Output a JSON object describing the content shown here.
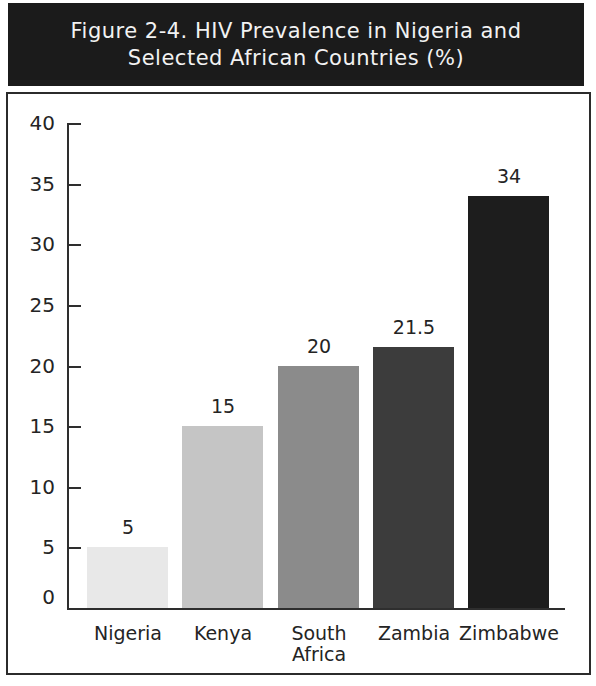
{
  "title": {
    "line1": "Figure 2-4. HIV Prevalence in Nigeria and",
    "line2": "Selected African Countries (%)"
  },
  "colors": {
    "title_bg": "#1b1b1b",
    "title_text": "#f2f2f2",
    "border": "#2b2b2b",
    "axis": "#2e2e2e",
    "label_text": "#242424"
  },
  "chart_data": {
    "type": "bar",
    "title": "Figure 2-4. HIV Prevalence in Nigeria and Selected African Countries (%)",
    "categories": [
      "Nigeria",
      "Kenya",
      "South Africa",
      "Zambia",
      "Zimbabwe"
    ],
    "values": [
      5,
      15,
      20,
      21.5,
      34
    ],
    "value_labels": [
      "5",
      "15",
      "20",
      "21.5",
      "34"
    ],
    "bar_colors": [
      "#e8e8e8",
      "#c5c5c5",
      "#8b8b8b",
      "#3c3c3c",
      "#1d1d1d"
    ],
    "xlabel": "",
    "ylabel": "",
    "ylim": [
      0,
      40
    ],
    "yticks": [
      0,
      5,
      10,
      15,
      20,
      25,
      30,
      35,
      40
    ],
    "grid": false,
    "legend": null
  }
}
